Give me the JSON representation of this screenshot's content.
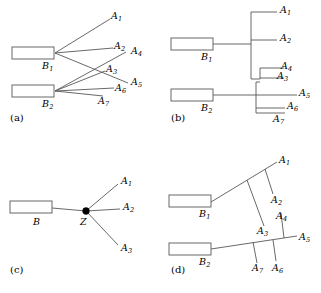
{
  "figure": {
    "width": 321,
    "height": 293,
    "background": "#ffffff",
    "line_color": "#58585a",
    "text_color": "#000000",
    "node_color": "#000000"
  },
  "panels": [
    {
      "id": "a",
      "tag": "(a)",
      "sources": [
        {
          "name": "B1",
          "label": "B",
          "sub": "1"
        },
        {
          "name": "B2",
          "label": "B",
          "sub": "2"
        }
      ],
      "targets": [
        {
          "name": "A1",
          "label": "A",
          "sub": "1"
        },
        {
          "name": "A2",
          "label": "A",
          "sub": "2"
        },
        {
          "name": "A3",
          "label": "A",
          "sub": "3"
        },
        {
          "name": "A4",
          "label": "A",
          "sub": "4"
        },
        {
          "name": "A5",
          "label": "A",
          "sub": "5"
        },
        {
          "name": "A6",
          "label": "A",
          "sub": "6"
        },
        {
          "name": "A7",
          "label": "A",
          "sub": "7"
        }
      ]
    },
    {
      "id": "b",
      "tag": "(b)",
      "sources": [
        {
          "name": "B1",
          "label": "B",
          "sub": "1"
        },
        {
          "name": "B2",
          "label": "B",
          "sub": "2"
        }
      ],
      "targets": [
        {
          "name": "A1",
          "label": "A",
          "sub": "1"
        },
        {
          "name": "A2",
          "label": "A",
          "sub": "2"
        },
        {
          "name": "A3",
          "label": "A",
          "sub": "3"
        },
        {
          "name": "A4",
          "label": "A",
          "sub": "4"
        },
        {
          "name": "A5",
          "label": "A",
          "sub": "5"
        },
        {
          "name": "A6",
          "label": "A",
          "sub": "6"
        },
        {
          "name": "A7",
          "label": "A",
          "sub": "7"
        }
      ]
    },
    {
      "id": "c",
      "tag": "(c)",
      "sources": [
        {
          "name": "B",
          "label": "B",
          "sub": ""
        }
      ],
      "hub": {
        "name": "Z",
        "label": "Z",
        "sub": ""
      },
      "targets": [
        {
          "name": "A1",
          "label": "A",
          "sub": "1"
        },
        {
          "name": "A2",
          "label": "A",
          "sub": "2"
        },
        {
          "name": "A3",
          "label": "A",
          "sub": "3"
        }
      ]
    },
    {
      "id": "d",
      "tag": "(d)",
      "sources": [
        {
          "name": "B1",
          "label": "B",
          "sub": "1"
        },
        {
          "name": "B2",
          "label": "B",
          "sub": "2"
        }
      ],
      "targets": [
        {
          "name": "A1",
          "label": "A",
          "sub": "1"
        },
        {
          "name": "A2",
          "label": "A",
          "sub": "2"
        },
        {
          "name": "A3",
          "label": "A",
          "sub": "3"
        },
        {
          "name": "A4",
          "label": "A",
          "sub": "4"
        },
        {
          "name": "A5",
          "label": "A",
          "sub": "5"
        },
        {
          "name": "A6",
          "label": "A",
          "sub": "6"
        },
        {
          "name": "A7",
          "label": "A",
          "sub": "7"
        }
      ]
    }
  ],
  "labels": {
    "a": {
      "tag": "(a)",
      "B1": "B",
      "B1sub": "1",
      "B2": "B",
      "B2sub": "2",
      "A1": "A",
      "A1sub": "1",
      "A2": "A",
      "A2sub": "2",
      "A3": "A",
      "A3sub": "3",
      "A4": "A",
      "A4sub": "4",
      "A5": "A",
      "A5sub": "5",
      "A6": "A",
      "A6sub": "6",
      "A7": "A",
      "A7sub": "7"
    },
    "b": {
      "tag": "(b)",
      "B1": "B",
      "B1sub": "1",
      "B2": "B",
      "B2sub": "2",
      "A1": "A",
      "A1sub": "1",
      "A2": "A",
      "A2sub": "2",
      "A3": "A",
      "A3sub": "3",
      "A4": "A",
      "A4sub": "4",
      "A5": "A",
      "A5sub": "5",
      "A6": "A",
      "A6sub": "6",
      "A7": "A",
      "A7sub": "7"
    },
    "c": {
      "tag": "(c)",
      "B": "B",
      "Z": "Z",
      "A1": "A",
      "A1sub": "1",
      "A2": "A",
      "A2sub": "2",
      "A3": "A",
      "A3sub": "3"
    },
    "d": {
      "tag": "(d)",
      "B1": "B",
      "B1sub": "1",
      "B2": "B",
      "B2sub": "2",
      "A1": "A",
      "A1sub": "1",
      "A2": "A",
      "A2sub": "2",
      "A3": "A",
      "A3sub": "3",
      "A4": "A",
      "A4sub": "4",
      "A5": "A",
      "A5sub": "5",
      "A6": "A",
      "A6sub": "6",
      "A7": "A",
      "A7sub": "7"
    }
  }
}
